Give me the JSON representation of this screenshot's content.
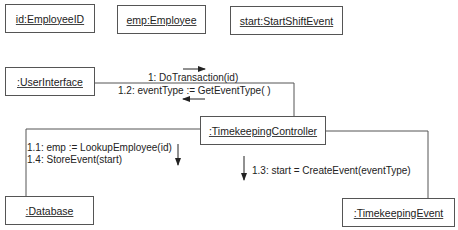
{
  "diagram": {
    "type": "UML collaboration diagram",
    "objects": [
      {
        "id": "employee-id",
        "label": "id:EmployeeID"
      },
      {
        "id": "employee",
        "label": "emp:Employee"
      },
      {
        "id": "start-shift-event",
        "label": "start:StartShiftEvent"
      },
      {
        "id": "user-interface",
        "label": ":UserInterface"
      },
      {
        "id": "timekeeping-controller",
        "label": ":TimekeepingController"
      },
      {
        "id": "database",
        "label": ":Database"
      },
      {
        "id": "timekeeping-event",
        "label": ":TimekeepingEvent"
      }
    ],
    "messages": [
      {
        "seq": "1",
        "text": "1: DoTransaction(id)",
        "from": ":UserInterface",
        "to": ":TimekeepingController",
        "direction": "right"
      },
      {
        "seq": "1.2",
        "text": "1.2: eventType := GetEventType( )",
        "from": ":TimekeepingController",
        "to": ":UserInterface",
        "direction": "left"
      },
      {
        "seq": "1.1",
        "text": "1.1: emp := LookupEmployee(id)",
        "from": ":TimekeepingController",
        "to": ":Database",
        "direction": "down"
      },
      {
        "seq": "1.4",
        "text": "1.4: StoreEvent(start)",
        "from": ":TimekeepingController",
        "to": ":Database",
        "direction": "down"
      },
      {
        "seq": "1.3",
        "text": "1.3: start = CreateEvent(eventType)",
        "from": ":TimekeepingController",
        "to": ":TimekeepingEvent",
        "direction": "down"
      }
    ],
    "colors": {
      "line": "#555555",
      "text": "#222222",
      "background": "#ffffff"
    }
  }
}
